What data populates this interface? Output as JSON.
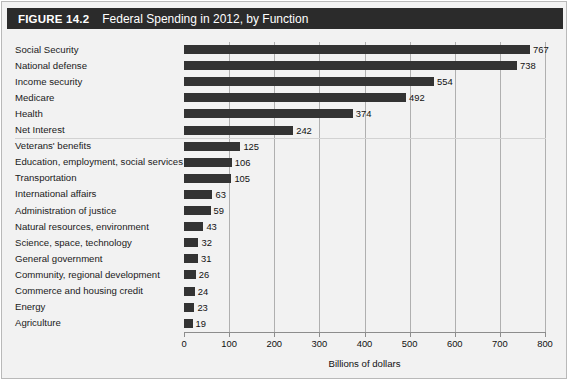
{
  "header": {
    "figure_number": "FIGURE 14.2",
    "title": "Federal Spending in 2012, by Function",
    "bar_color": "#2b2b2b",
    "text_color": "#ffffff"
  },
  "chart_data": {
    "type": "bar",
    "orientation": "horizontal",
    "title": "Federal Spending in 2012, by Function",
    "xlabel": "Billions of dollars",
    "ylabel": "",
    "xlim": [
      0,
      800
    ],
    "xticks": [
      0,
      100,
      200,
      300,
      400,
      500,
      600,
      700,
      800
    ],
    "xtick_labels": [
      "0",
      "100",
      "200",
      "300",
      "400",
      "500",
      "600",
      "700",
      "800"
    ],
    "grid": "vertical",
    "legend": "none",
    "bar_color": "#333333",
    "categories": [
      "Social Security",
      "National defense",
      "Income security",
      "Medicare",
      "Health",
      "Net Interest",
      "Veterans' benefits",
      "Education, employment, social services",
      "Transportation",
      "International affairs",
      "Administration of justice",
      "Natural resources, environment",
      "Science, space, technology",
      "General government",
      "Community, regional development",
      "Commerce and housing credit",
      "Energy",
      "Agriculture"
    ],
    "values": [
      767,
      738,
      554,
      492,
      374,
      242,
      125,
      106,
      105,
      63,
      59,
      43,
      32,
      31,
      26,
      24,
      23,
      19
    ],
    "value_labels": [
      "767",
      "738",
      "554",
      "492",
      "374",
      "242",
      "125",
      "106",
      "105",
      "63",
      "59",
      "43",
      "32",
      "31",
      "26",
      "24",
      "23",
      "19"
    ],
    "separator_after_index": 5
  }
}
